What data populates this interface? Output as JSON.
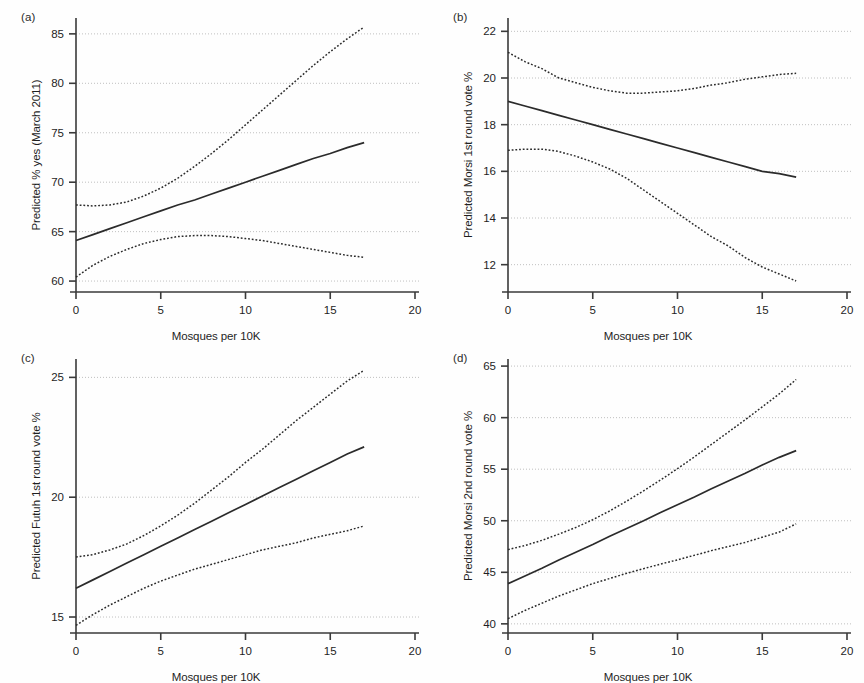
{
  "figure": {
    "width": 864,
    "height": 683,
    "background": "#fefefe",
    "line_color": "#2b2b2b",
    "grid_color": "#b9b9b9",
    "axis_color": "#3a3a3a"
  },
  "panels": [
    {
      "tag": "(a)",
      "ylabel": "Predicted % yes (March 2011)",
      "xlabel": "Mosques per 10K",
      "yticks": [
        "60",
        "65",
        "70",
        "75",
        "80",
        "85"
      ],
      "xticks": [
        "0",
        "5",
        "10",
        "15",
        "20"
      ]
    },
    {
      "tag": "(b)",
      "ylabel": "Predicted Morsi 1st round vote %",
      "xlabel": "Mosques per 10K",
      "yticks": [
        "12",
        "14",
        "16",
        "18",
        "20",
        "22"
      ],
      "xticks": [
        "0",
        "5",
        "10",
        "15",
        "20"
      ]
    },
    {
      "tag": "(c)",
      "ylabel": "Predicted Futuh 1st round vote %",
      "xlabel": "Mosques per 10K",
      "yticks": [
        "15",
        "20",
        "25"
      ],
      "xticks": [
        "0",
        "5",
        "10",
        "15",
        "20"
      ]
    },
    {
      "tag": "(d)",
      "ylabel": "Predicted Morsi 2nd round vote %",
      "xlabel": "Mosques per 10K",
      "yticks": [
        "40",
        "45",
        "50",
        "55",
        "60",
        "65"
      ],
      "xticks": [
        "0",
        "5",
        "10",
        "15",
        "20"
      ]
    }
  ],
  "chart_data": [
    {
      "type": "line",
      "panel": "(a)",
      "title": "",
      "xlabel": "Mosques per 10K",
      "ylabel": "Predicted % yes (March 2011)",
      "xlim": [
        0,
        20
      ],
      "ylim": [
        59.3,
        86.2
      ],
      "xticks": [
        0,
        5,
        10,
        15,
        20
      ],
      "yticks": [
        60,
        65,
        70,
        75,
        80,
        85
      ],
      "grid": true,
      "legend": "none",
      "x": [
        0,
        1,
        2,
        3,
        4,
        5,
        6,
        7,
        8,
        9,
        10,
        11,
        12,
        13,
        14,
        15,
        16,
        17
      ],
      "series": [
        {
          "name": "Predicted value",
          "style": "solid",
          "values": [
            64.1,
            64.7,
            65.3,
            65.9,
            66.5,
            67.1,
            67.7,
            68.2,
            68.8,
            69.4,
            70.0,
            70.6,
            71.2,
            71.8,
            72.4,
            72.9,
            73.5,
            74.0
          ]
        },
        {
          "name": "Upper 95% CI",
          "style": "dotted",
          "values": [
            67.7,
            67.6,
            67.7,
            68.0,
            68.6,
            69.4,
            70.4,
            71.6,
            72.9,
            74.3,
            75.8,
            77.3,
            78.8,
            80.3,
            81.8,
            83.2,
            84.5,
            85.7
          ]
        },
        {
          "name": "Lower 95% CI",
          "style": "dotted",
          "values": [
            60.4,
            61.6,
            62.5,
            63.2,
            63.8,
            64.2,
            64.5,
            64.6,
            64.6,
            64.5,
            64.3,
            64.1,
            63.8,
            63.5,
            63.2,
            62.9,
            62.6,
            62.4
          ]
        }
      ]
    },
    {
      "type": "line",
      "panel": "(b)",
      "title": "",
      "xlabel": "Mosques per 10K",
      "ylabel": "Predicted Morsi 1st round vote %",
      "xlim": [
        0,
        20
      ],
      "ylim": [
        11.0,
        22.4
      ],
      "xticks": [
        0,
        5,
        10,
        15,
        20
      ],
      "yticks": [
        12,
        14,
        16,
        18,
        20,
        22
      ],
      "grid": true,
      "legend": "none",
      "x": [
        0,
        1,
        2,
        3,
        4,
        5,
        6,
        7,
        8,
        9,
        10,
        11,
        12,
        13,
        14,
        15,
        16,
        17
      ],
      "series": [
        {
          "name": "Predicted value",
          "style": "solid",
          "values": [
            19.0,
            18.8,
            18.6,
            18.4,
            18.2,
            18.0,
            17.8,
            17.6,
            17.4,
            17.2,
            17.0,
            16.8,
            16.6,
            16.4,
            16.2,
            16.0,
            15.9,
            15.75
          ]
        },
        {
          "name": "Upper 95% CI",
          "style": "dotted",
          "values": [
            21.1,
            20.7,
            20.4,
            20.0,
            19.8,
            19.6,
            19.45,
            19.35,
            19.35,
            19.4,
            19.45,
            19.55,
            19.7,
            19.8,
            19.95,
            20.05,
            20.15,
            20.2
          ]
        },
        {
          "name": "Lower 95% CI",
          "style": "dotted",
          "values": [
            16.9,
            16.95,
            16.95,
            16.85,
            16.65,
            16.4,
            16.1,
            15.7,
            15.2,
            14.7,
            14.2,
            13.7,
            13.2,
            12.8,
            12.3,
            11.9,
            11.6,
            11.3
          ]
        }
      ]
    },
    {
      "type": "line",
      "panel": "(c)",
      "title": "",
      "xlabel": "Mosques per 10K",
      "ylabel": "Predicted Futuh 1st round vote %",
      "xlim": [
        0,
        20
      ],
      "ylim": [
        14.5,
        25.6
      ],
      "xticks": [
        0,
        5,
        10,
        15,
        20
      ],
      "yticks": [
        15,
        20,
        25
      ],
      "grid": true,
      "legend": "none",
      "x": [
        0,
        1,
        2,
        3,
        4,
        5,
        6,
        7,
        8,
        9,
        10,
        11,
        12,
        13,
        14,
        15,
        16,
        17
      ],
      "series": [
        {
          "name": "Predicted value",
          "style": "solid",
          "values": [
            16.2,
            16.55,
            16.9,
            17.25,
            17.6,
            17.95,
            18.3,
            18.65,
            19.0,
            19.35,
            19.7,
            20.05,
            20.4,
            20.75,
            21.1,
            21.45,
            21.8,
            22.1
          ]
        },
        {
          "name": "Upper 95% CI",
          "style": "dotted",
          "values": [
            17.5,
            17.6,
            17.8,
            18.05,
            18.4,
            18.8,
            19.25,
            19.75,
            20.3,
            20.85,
            21.45,
            22.0,
            22.6,
            23.2,
            23.75,
            24.3,
            24.85,
            25.3
          ]
        },
        {
          "name": "Lower 95% CI",
          "style": "dotted",
          "values": [
            14.65,
            15.1,
            15.5,
            15.85,
            16.2,
            16.5,
            16.75,
            17.0,
            17.2,
            17.4,
            17.6,
            17.8,
            17.95,
            18.1,
            18.3,
            18.45,
            18.6,
            18.8
          ]
        }
      ]
    },
    {
      "type": "line",
      "panel": "(d)",
      "title": "",
      "xlabel": "Mosques per 10K",
      "ylabel": "Predicted Morsi 2nd round vote %",
      "xlim": [
        0,
        20
      ],
      "ylim": [
        39.5,
        65.3
      ],
      "xticks": [
        0,
        5,
        10,
        15,
        20
      ],
      "yticks": [
        40,
        45,
        50,
        55,
        60,
        65
      ],
      "grid": true,
      "legend": "none",
      "x": [
        0,
        1,
        2,
        3,
        4,
        5,
        6,
        7,
        8,
        9,
        10,
        11,
        12,
        13,
        14,
        15,
        16,
        17
      ],
      "series": [
        {
          "name": "Predicted value",
          "style": "solid",
          "values": [
            43.9,
            44.65,
            45.4,
            46.2,
            46.95,
            47.7,
            48.5,
            49.25,
            50.0,
            50.8,
            51.55,
            52.3,
            53.1,
            53.85,
            54.6,
            55.4,
            56.15,
            56.8
          ]
        },
        {
          "name": "Upper 95% CI",
          "style": "dotted",
          "values": [
            47.2,
            47.6,
            48.1,
            48.7,
            49.35,
            50.1,
            50.95,
            51.9,
            52.9,
            53.95,
            55.05,
            56.2,
            57.4,
            58.6,
            59.8,
            61.05,
            62.3,
            63.7
          ]
        },
        {
          "name": "Lower 95% CI",
          "style": "dotted",
          "values": [
            40.5,
            41.3,
            42.0,
            42.7,
            43.3,
            43.9,
            44.4,
            44.9,
            45.35,
            45.8,
            46.2,
            46.65,
            47.1,
            47.5,
            47.9,
            48.4,
            48.9,
            49.7
          ]
        }
      ]
    }
  ]
}
